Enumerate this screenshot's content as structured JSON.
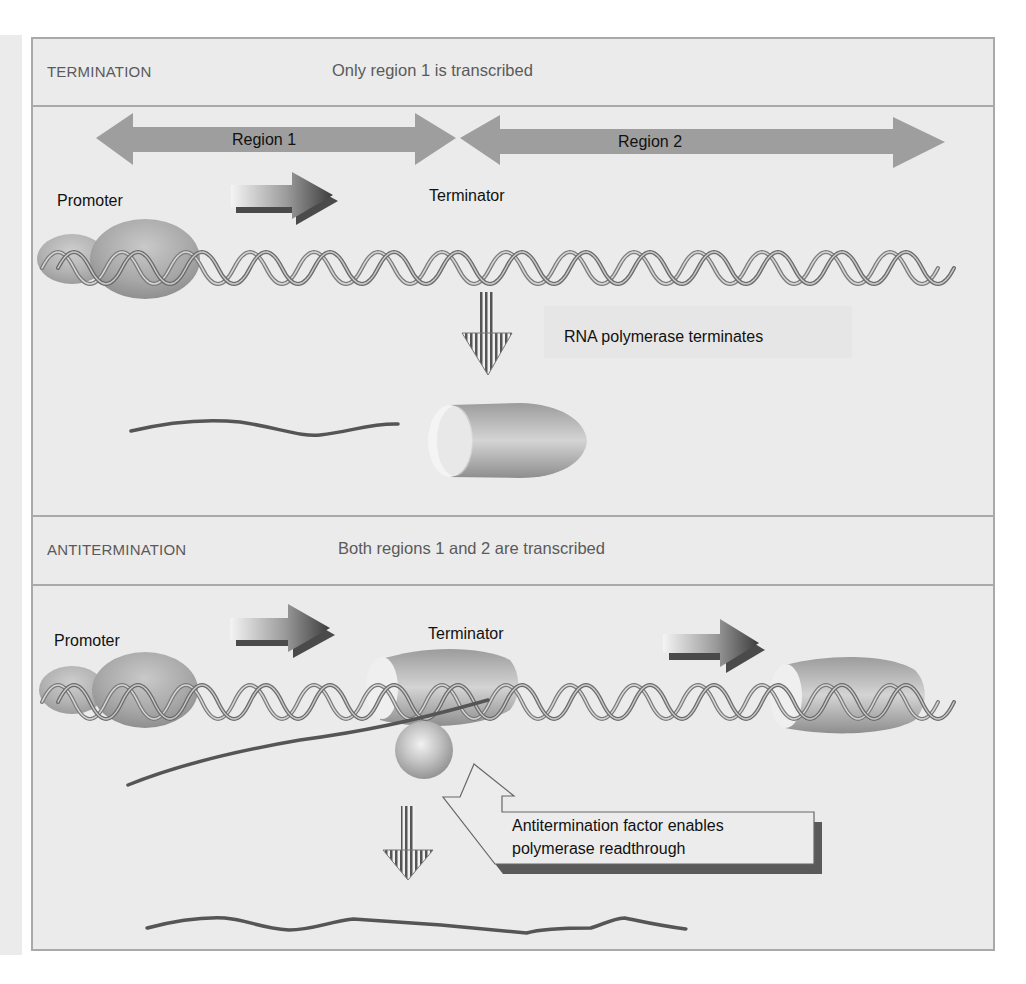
{
  "termination": {
    "title": "TERMINATION",
    "subtitle": "Only region 1 is transcribed",
    "region1_label": "Region 1",
    "region2_label": "Region 2",
    "promoter_label": "Promoter",
    "terminator_label": "Terminator",
    "event_label": "RNA polymerase terminates"
  },
  "antitermination": {
    "title": "ANTITERMINATION",
    "subtitle": "Both regions 1 and 2 are transcribed",
    "promoter_label": "Promoter",
    "terminator_label": "Terminator",
    "callout_line1": "Antitermination factor enables",
    "callout_line2": "polymerase readthrough"
  },
  "colors": {
    "panel_bg": "#ebebeb",
    "border": "#a9a9a9",
    "region_arrow": "#9e9e9e",
    "rna_strand": "#555555",
    "header_text": "#5a5a5a"
  },
  "icons": {
    "region_arrows": "double-headed-arrow-icon",
    "direction_arrows": "gradient-right-arrow-icon",
    "step_arrows": "striped-down-arrow-icon",
    "polymerase": "rna-polymerase-ellipsoid-icon",
    "factor": "antitermination-factor-sphere-icon",
    "dna": "dna-double-helix-icon"
  }
}
